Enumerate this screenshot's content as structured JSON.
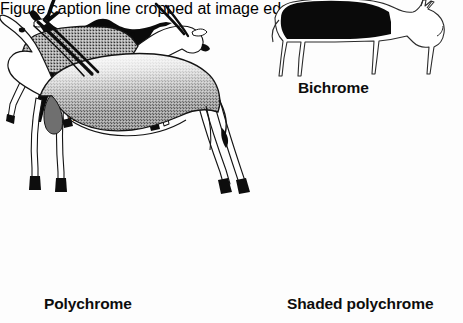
{
  "figure": {
    "background_color": "#fdfdfd",
    "ink_color": "#0d0d0d",
    "width": 463,
    "height": 323
  },
  "panels": [
    {
      "id": "monochrome",
      "caption": "Monochrome",
      "subject": "antelope",
      "facing": "left",
      "fill_style": "solid-black-silhouette",
      "fill_color": "#0a0a0a",
      "outline_color": "#0a0a0a"
    },
    {
      "id": "bichrome",
      "caption": "Bichrome",
      "subject": "cow",
      "facing": "right",
      "fill_style": "outline-with-solid-black-body-patch",
      "fill_color": "#0a0a0a",
      "outline_color": "#2b2b2b"
    },
    {
      "id": "polychrome",
      "caption": "Polychrome",
      "subject": "eland-antelope",
      "facing": "right",
      "fill_style": "uniform-stipple-gray-body-white-head-and-legs",
      "fill_color": "#8e8e8e",
      "outline_color": "#141414"
    },
    {
      "id": "shaded-polychrome",
      "caption": "Shaded polychrome",
      "subject": "eland-antelope",
      "facing": "left",
      "fill_style": "graded-stipple-dark-back-fading-to-white-belly",
      "fill_color": "#6f6f6f",
      "outline_color": "#141414"
    }
  ],
  "cropped_bottom_text": "Figure caption line cropped at image edge"
}
